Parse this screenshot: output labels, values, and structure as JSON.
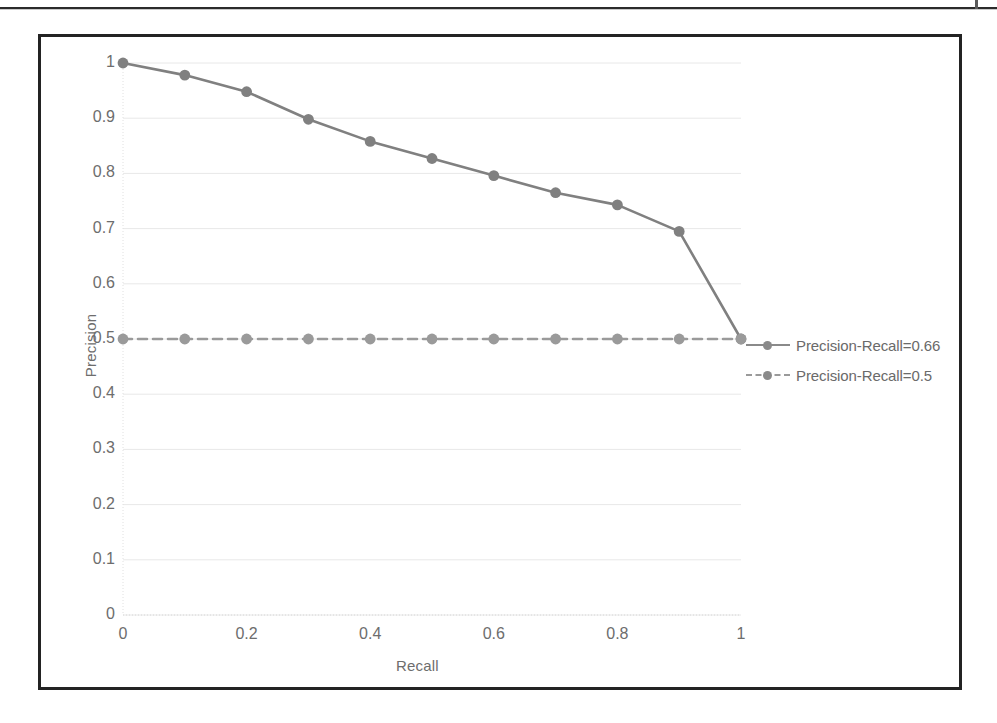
{
  "page": {
    "background_color": "#ffffff",
    "frame_color": "#232323"
  },
  "chart_data": {
    "type": "line",
    "title": "",
    "xlabel": "Recall",
    "ylabel": "Precision",
    "xlim": [
      0,
      1
    ],
    "ylim": [
      0,
      1
    ],
    "xticks": [
      "0",
      "0.2",
      "0.4",
      "0.6",
      "0.8",
      "1"
    ],
    "xtick_values": [
      0,
      0.2,
      0.4,
      0.6,
      0.8,
      1
    ],
    "yticks": [
      "0",
      "0.1",
      "0.2",
      "0.3",
      "0.4",
      "0.5",
      "0.6",
      "0.7",
      "0.8",
      "0.9",
      "1"
    ],
    "ytick_values": [
      0,
      0.1,
      0.2,
      0.3,
      0.4,
      0.5,
      0.6,
      0.7,
      0.8,
      0.9,
      1
    ],
    "grid": true,
    "grid_color": "#e8e8e8",
    "legend_position": "right",
    "x": [
      0,
      0.1,
      0.2,
      0.3,
      0.4,
      0.5,
      0.6,
      0.7,
      0.8,
      0.9,
      1
    ],
    "series": [
      {
        "name": "Precision-Recall=0.66",
        "color": "#808080",
        "linestyle": "solid",
        "marker": "circle",
        "values": [
          1.0,
          0.978,
          0.948,
          0.898,
          0.858,
          0.827,
          0.796,
          0.765,
          0.743,
          0.695,
          0.5
        ]
      },
      {
        "name": "Precision-Recall=0.5",
        "color": "#9a9a9a",
        "linestyle": "dashed",
        "marker": "circle",
        "values": [
          0.5,
          0.5,
          0.5,
          0.5,
          0.5,
          0.5,
          0.5,
          0.5,
          0.5,
          0.5,
          0.5
        ]
      }
    ]
  },
  "legend": {
    "items": [
      {
        "label": "Precision-Recall=0.66",
        "style": "solid"
      },
      {
        "label": "Precision-Recall=0.5",
        "style": "dashed"
      }
    ]
  }
}
